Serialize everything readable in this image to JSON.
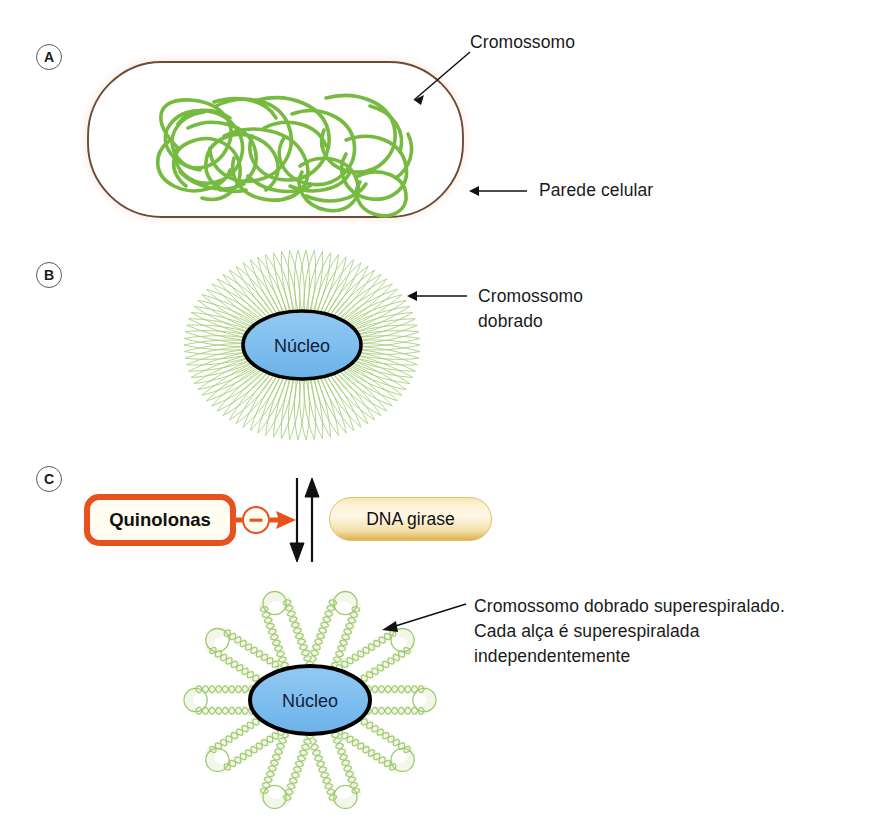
{
  "figure": {
    "width": 877,
    "height": 824,
    "background": "#ffffff"
  },
  "panels": [
    {
      "id": "A",
      "badge": "A",
      "description": "Bacterial cell with tangled chromosome inside cell wall"
    },
    {
      "id": "B",
      "badge": "B",
      "description": "Folded chromosome loops radiating from nucleus"
    },
    {
      "id": "C",
      "badge": "C",
      "description": "Quinolones inhibit DNA gyrase; supercoiled folded chromosome"
    }
  ],
  "labels": {
    "chromosome": "Cromossomo",
    "cell_wall": "Parede celular",
    "folded_chromosome": "Cromossomo\ndobrado",
    "nucleus_b": "Núcleo",
    "nucleus_c": "Núcleo",
    "supercoiled_note": "Cromossomo dobrado superespiralado.\nCada alça é superespiralada\nindependentemente"
  },
  "panel_c": {
    "quinolones_label": "Quinolonas",
    "dna_gyrase_label": "DNA girase",
    "inhibition_symbol": "−",
    "equilibrium_arrow_up": "up-arrow",
    "equilibrium_arrow_down": "down-arrow"
  },
  "colors": {
    "chromosome_green": "#76bb3f",
    "loop_green": "#a9ce7a",
    "cell_wall_brown": "#6b4a36",
    "cell_glow_pink": "#fbe6e0",
    "nucleus_blue": "#7dbdee",
    "nucleus_stroke": "#000000",
    "quinolones_border": "#e8511d",
    "quinolones_fill": "#fffdf0",
    "gyrase_gold": "#f0dca2",
    "gyrase_edge": "#d9a83f",
    "arrow_black": "#111111",
    "text_black": "#1a1a1a",
    "badge_stroke": "#5a5a5a"
  },
  "geometry": {
    "panelA": {
      "cell_x": 88,
      "cell_y": 62,
      "cell_w": 375,
      "cell_h": 155
    },
    "panelB": {
      "center_x": 302,
      "center_y": 345,
      "rx": 118,
      "ry": 95,
      "loops": 90
    },
    "panelC_flower": {
      "center_x": 310,
      "center_y": 700,
      "petals": 10
    }
  }
}
